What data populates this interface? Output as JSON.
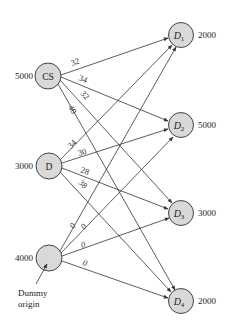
{
  "diagram": {
    "type": "transportation-network",
    "sources": [
      {
        "id": "CS",
        "label": "CS",
        "supply": "5000",
        "x": 48,
        "y": 76
      },
      {
        "id": "D",
        "label": "D",
        "supply": "3000",
        "x": 49,
        "y": 166
      },
      {
        "id": "Dummy",
        "label": "",
        "supply": "4000",
        "x": 49,
        "y": 258
      }
    ],
    "destinations": [
      {
        "id": "D1",
        "label": "D",
        "sub": "1",
        "demand": "2000",
        "x": 181,
        "y": 35
      },
      {
        "id": "D2",
        "label": "D",
        "sub": "2",
        "demand": "5000",
        "x": 181,
        "y": 125
      },
      {
        "id": "D3",
        "label": "D",
        "sub": "3",
        "demand": "3000",
        "x": 181,
        "y": 213
      },
      {
        "id": "D4",
        "label": "D",
        "sub": "4",
        "demand": "2000",
        "x": 181,
        "y": 301
      }
    ],
    "edges": [
      {
        "from": "CS",
        "to": "D1",
        "cost": "32"
      },
      {
        "from": "CS",
        "to": "D2",
        "cost": "34"
      },
      {
        "from": "CS",
        "to": "D3",
        "cost": "32"
      },
      {
        "from": "CS",
        "to": "D4",
        "cost": "40"
      },
      {
        "from": "D",
        "to": "D1",
        "cost": "34"
      },
      {
        "from": "D",
        "to": "D2",
        "cost": "30"
      },
      {
        "from": "D",
        "to": "D3",
        "cost": "28"
      },
      {
        "from": "D",
        "to": "D4",
        "cost": "38"
      },
      {
        "from": "Dummy",
        "to": "D1",
        "cost": "0"
      },
      {
        "from": "Dummy",
        "to": "D2",
        "cost": "0"
      },
      {
        "from": "Dummy",
        "to": "D3",
        "cost": "0"
      },
      {
        "from": "Dummy",
        "to": "D4",
        "cost": "0"
      }
    ],
    "annotation": {
      "line1": "Dummy",
      "line2": "origin"
    }
  },
  "colors": {
    "node_fill": "#d9d9d9",
    "node_stroke": "#444444",
    "edge": "#333333"
  }
}
